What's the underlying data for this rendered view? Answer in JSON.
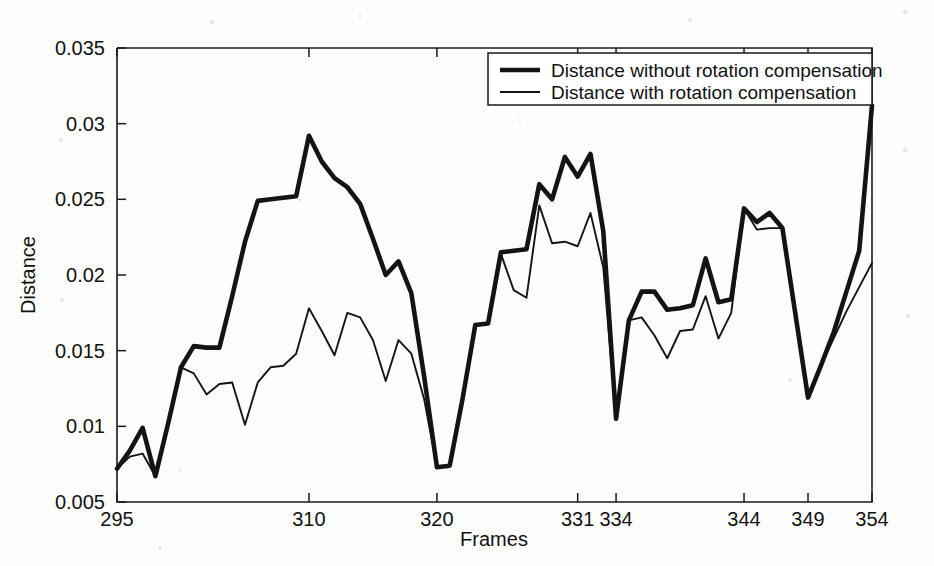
{
  "chart_data": {
    "type": "line",
    "title": "",
    "xlabel": "Frames",
    "ylabel": "Distance",
    "xlim": [
      295,
      354
    ],
    "ylim": [
      0.005,
      0.035
    ],
    "xticks": [
      295,
      310,
      320,
      331,
      334,
      344,
      349,
      354
    ],
    "xtick_labels": [
      "295",
      "310",
      "320",
      "331",
      "334",
      "344",
      "349",
      "354"
    ],
    "yticks": [
      0.005,
      0.01,
      0.015,
      0.02,
      0.025,
      0.03,
      0.035
    ],
    "ytick_labels": [
      "0.005",
      "0.01",
      "0.015",
      "0.02",
      "0.025",
      "0.03",
      "0.035"
    ],
    "grid": false,
    "legend_position": "top-right",
    "x": [
      295,
      296,
      297,
      298,
      299,
      300,
      301,
      302,
      303,
      304,
      305,
      306,
      307,
      308,
      309,
      310,
      311,
      312,
      313,
      314,
      315,
      316,
      317,
      318,
      319,
      320,
      321,
      322,
      323,
      324,
      325,
      326,
      327,
      328,
      329,
      330,
      331,
      332,
      333,
      334,
      335,
      336,
      337,
      338,
      339,
      340,
      341,
      342,
      343,
      344,
      345,
      346,
      347,
      348,
      349,
      350,
      351,
      352,
      353,
      354
    ],
    "series": [
      {
        "name": "Distance without rotation compensation",
        "style": "thick",
        "values": [
          0.0072,
          0.0084,
          0.0099,
          0.0067,
          0.0102,
          0.0139,
          0.0153,
          0.0152,
          0.0152,
          0.0186,
          0.0222,
          0.0249,
          0.025,
          0.0251,
          0.0252,
          0.0292,
          0.0275,
          0.0264,
          0.0258,
          0.0247,
          0.0224,
          0.02,
          0.0209,
          0.0188,
          0.0133,
          0.0073,
          0.0074,
          0.0118,
          0.0167,
          0.0168,
          0.0215,
          0.0216,
          0.0217,
          0.026,
          0.025,
          0.0278,
          0.0265,
          0.028,
          0.0229,
          0.0105,
          0.017,
          0.0189,
          0.0189,
          0.0177,
          0.0178,
          0.018,
          0.0211,
          0.0182,
          0.0184,
          0.0244,
          0.0235,
          0.0241,
          0.0231,
          0.0175,
          0.0119,
          0.014,
          0.0162,
          0.0189,
          0.0216,
          0.0312
        ]
      },
      {
        "name": "Distance with rotation compensation",
        "style": "thin",
        "values": [
          0.0072,
          0.008,
          0.0082,
          0.0067,
          0.0102,
          0.0139,
          0.0135,
          0.0121,
          0.0128,
          0.0129,
          0.0101,
          0.0129,
          0.0139,
          0.014,
          0.0148,
          0.0178,
          0.0163,
          0.0147,
          0.0175,
          0.0172,
          0.0157,
          0.013,
          0.0157,
          0.0148,
          0.0118,
          0.0073,
          0.0074,
          0.0118,
          0.0167,
          0.0168,
          0.0214,
          0.019,
          0.0185,
          0.0246,
          0.0221,
          0.0222,
          0.0219,
          0.0241,
          0.0205,
          0.0105,
          0.017,
          0.0172,
          0.016,
          0.0145,
          0.0163,
          0.0164,
          0.0186,
          0.0158,
          0.0175,
          0.0244,
          0.023,
          0.0231,
          0.0231,
          0.0175,
          0.0119,
          0.014,
          0.0158,
          0.0176,
          0.0192,
          0.0208
        ]
      }
    ]
  },
  "legend": {
    "entries": [
      {
        "label": "Distance without rotation compensation"
      },
      {
        "label": "Distance with rotation compensation"
      }
    ]
  },
  "colors": {
    "line": "#141414",
    "axis": "#1a1a1a",
    "background": "#fdfdfc"
  }
}
